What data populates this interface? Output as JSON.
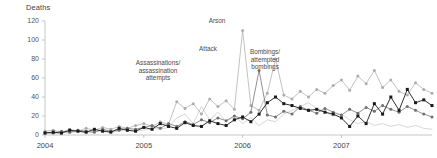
{
  "chart_data": {
    "type": "line",
    "title": "",
    "ylabel": "Deaths",
    "xlabel": "",
    "ylim": [
      0,
      120
    ],
    "yticks": [
      0,
      20,
      40,
      60,
      80,
      100,
      120
    ],
    "xticks": [
      "2004",
      "2005",
      "2006",
      "2007"
    ],
    "grid": false,
    "legend": "none",
    "x_count": 48,
    "x_start": "2004-01",
    "x_end": "2007-12",
    "annotations": [
      {
        "text": "Assassinations/\nassassination\nattempts",
        "x_index": 19,
        "value": 22
      },
      {
        "text": "Attack",
        "x_index": 22,
        "value": 68
      },
      {
        "text": "Arson",
        "x_index": 25,
        "value": 110
      },
      {
        "text": "Bombings/\nattempted\nbombings",
        "x_index": 30,
        "value": 80
      }
    ],
    "series": [
      {
        "name": "Bombings/attempted bombings",
        "color": "#1a1a1a",
        "marker": "square",
        "values": [
          2,
          3,
          2,
          5,
          4,
          3,
          6,
          4,
          3,
          7,
          5,
          4,
          8,
          6,
          12,
          9,
          7,
          13,
          10,
          9,
          15,
          12,
          10,
          16,
          19,
          14,
          22,
          34,
          40,
          33,
          31,
          28,
          26,
          27,
          24,
          22,
          18,
          9,
          20,
          12,
          33,
          22,
          40,
          26,
          48,
          34,
          37,
          31
        ]
      },
      {
        "name": "Attack",
        "color": "#6f6f6f",
        "marker": "diamond",
        "values": [
          3,
          2,
          4,
          3,
          5,
          4,
          3,
          6,
          4,
          5,
          7,
          6,
          8,
          10,
          7,
          12,
          9,
          14,
          11,
          16,
          13,
          18,
          15,
          20,
          17,
          24,
          68,
          21,
          19,
          25,
          22,
          30,
          26,
          23,
          28,
          24,
          21,
          27,
          23,
          29,
          25,
          31,
          27,
          24,
          30,
          26,
          22,
          19
        ]
      },
      {
        "name": "Assassinations/assassination attempts",
        "color": "#adadad",
        "marker": "diamond",
        "values": [
          4,
          5,
          3,
          6,
          4,
          7,
          5,
          8,
          6,
          9,
          7,
          10,
          12,
          9,
          14,
          11,
          35,
          28,
          33,
          22,
          38,
          30,
          36,
          27,
          110,
          31,
          26,
          44,
          80,
          42,
          38,
          46,
          40,
          48,
          44,
          52,
          58,
          47,
          62,
          54,
          68,
          50,
          58,
          46,
          42,
          55,
          48,
          44
        ]
      },
      {
        "name": "Arson",
        "color": "#cacaca",
        "marker": "none",
        "values": [
          2,
          1,
          3,
          2,
          4,
          2,
          3,
          5,
          3,
          4,
          6,
          4,
          5,
          7,
          6,
          8,
          18,
          22,
          12,
          30,
          16,
          24,
          14,
          20,
          12,
          18,
          10,
          16,
          14,
          22,
          26,
          30,
          34,
          28,
          24,
          20,
          22,
          16,
          12,
          14,
          10,
          12,
          9,
          11,
          8,
          10,
          7,
          6
        ]
      }
    ]
  }
}
